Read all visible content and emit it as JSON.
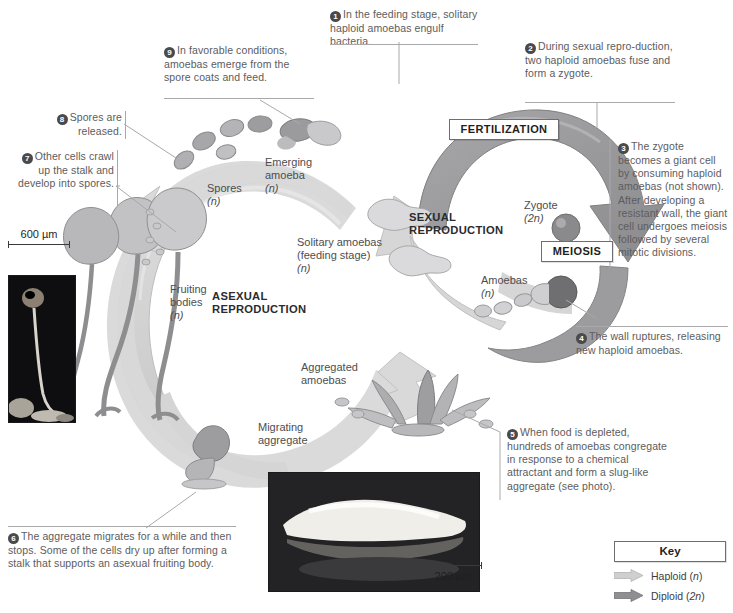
{
  "figure": {
    "caption": ""
  },
  "steps": [
    {
      "n": "1",
      "text": "In the feeding stage, solitary haploid amoebas engulf bacteria."
    },
    {
      "n": "2",
      "text": "During sexual repro-duction, two haploid amoebas fuse and form a zygote."
    },
    {
      "n": "3",
      "text": "The zygote becomes a giant cell by consuming haploid amoebas (not shown). After developing a resistant wall, the giant cell undergoes meiosis followed by several mitotic divisions."
    },
    {
      "n": "4",
      "text": "The wall ruptures, releasing new haploid amoebas."
    },
    {
      "n": "5",
      "text": "When food is depleted, hundreds of amoebas congregate in response to a chemical attractant and form a slug-like aggregate (see photo)."
    },
    {
      "n": "6",
      "text": "The aggregate migrates for a while and then stops. Some of the cells dry up after forming a stalk that supports an asexual fruiting body."
    },
    {
      "n": "7",
      "text": "Other cells crawl up the stalk and develop into spores."
    },
    {
      "n": "8",
      "text": "Spores are released."
    },
    {
      "n": "9",
      "text": "In favorable conditions, amoebas emerge from the spore coats and feed."
    }
  ],
  "stage_boxes": {
    "fertilization": "FERTILIZATION",
    "meiosis": "MEIOSIS"
  },
  "cycle_labels": {
    "sexual_reproduction": "SEXUAL\nREPRODUCTION",
    "sexual_reproduction_line1": "SEXUAL",
    "sexual_reproduction_line2": "REPRODUCTION",
    "asexual_reproduction_line1": "ASEXUAL",
    "asexual_reproduction_line2": "REPRODUCTION"
  },
  "part_labels": {
    "emerging_amoeba_line1": "Emerging",
    "emerging_amoeba_line2": "amoeba",
    "emerging_amoeba_ploidy": "(n)",
    "spores_line1": "Spores",
    "spores_ploidy": "(n)",
    "solitary_amoebas_line1": "Solitary amoebas",
    "solitary_amoebas_line2": "(feeding stage)",
    "solitary_amoebas_ploidy": "(n)",
    "zygote_line1": "Zygote",
    "zygote_ploidy": "(2n)",
    "amoebas_line1": "Amoebas",
    "amoebas_ploidy": "(n)",
    "fruiting_bodies_line1": "Fruiting",
    "fruiting_bodies_line2": "bodies",
    "fruiting_bodies_ploidy": "(n)",
    "aggregated_amoebas_line1": "Aggregated",
    "aggregated_amoebas_line2": "amoebas",
    "migrating_aggregate_line1": "Migrating",
    "migrating_aggregate_line2": "aggregate"
  },
  "key": {
    "title": "Key",
    "entries": [
      {
        "label_text": "Haploid (",
        "ploidy": "n",
        "label_tail": ")",
        "color": "#cfcfcf",
        "name": "haploid"
      },
      {
        "label_text": "Diploid (",
        "ploidy": "2n",
        "label_tail": ")",
        "color": "#8f8f91",
        "name": "diploid"
      }
    ]
  },
  "scale_bars": [
    {
      "name": "fruiting-body-photo-scale",
      "value": "600 µm"
    },
    {
      "name": "slug-photo-scale",
      "value": "200 µm"
    }
  ],
  "colors": {
    "haploid_arrow": "#d2d2d2",
    "diploid_arrow": "#9a9a9c",
    "text": "#58585a",
    "rule": "#a9a9ab",
    "box_border": "#6e6e70"
  }
}
